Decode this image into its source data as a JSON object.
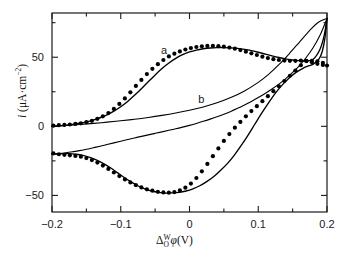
{
  "figure": {
    "background": "#ffffff",
    "ink_color": "#000000"
  },
  "chart_data": {
    "type": "line",
    "title": "",
    "subtitle": "",
    "xlabel": "Δ_O^W φ (V)",
    "xlabel_parts": {
      "delta": "Δ",
      "superscript": "W",
      "subscript": "O",
      "phi": "φ",
      "unit": "(V)"
    },
    "ylabel": "i (μA·cm⁻²)",
    "ylabel_parts": {
      "symbol": "i",
      "open": " (",
      "unit": "μA·cm",
      "exponent": "−2",
      "close": ")"
    },
    "xlim": [
      -0.2,
      0.2
    ],
    "ylim": [
      -62,
      82
    ],
    "x_major_ticks": [
      -0.2,
      -0.1,
      0,
      0.1,
      0.2
    ],
    "x_major_tick_labels": [
      "−0.2",
      "−0.1",
      "0",
      "0.1",
      "0.2"
    ],
    "x_minor_ticks": [
      -0.15,
      -0.05,
      0.05,
      0.15
    ],
    "y_major_ticks": [
      50,
      0,
      -50
    ],
    "y_major_tick_labels": [
      "50",
      "0",
      "−50"
    ],
    "y_minor_ticks": [
      75,
      25,
      -25
    ],
    "grid": false,
    "legend": "inline-annotations",
    "annotations": [
      {
        "text": "a",
        "x": -0.037,
        "y": 52,
        "name": "curve-label-a"
      },
      {
        "text": "b",
        "x": 0.017,
        "y": 17,
        "name": "curve-label-b"
      }
    ],
    "series": [
      {
        "name": "curve-a-forward",
        "style": "solid-line",
        "description": "Cyclic voltammogram a, forward (anodic) sweep from -0.2 V rising to a peak near +0.07 V then decreasing before final rise at +0.2 V",
        "points": [
          [
            -0.2,
            0.0
          ],
          [
            -0.19,
            0.4
          ],
          [
            -0.18,
            0.8
          ],
          [
            -0.17,
            1.4
          ],
          [
            -0.16,
            2.2
          ],
          [
            -0.15,
            3.2
          ],
          [
            -0.14,
            4.5
          ],
          [
            -0.13,
            6.2
          ],
          [
            -0.12,
            8.3
          ],
          [
            -0.11,
            11.0
          ],
          [
            -0.1,
            14.2
          ],
          [
            -0.09,
            18.0
          ],
          [
            -0.08,
            22.4
          ],
          [
            -0.07,
            27.2
          ],
          [
            -0.06,
            32.2
          ],
          [
            -0.05,
            37.2
          ],
          [
            -0.04,
            41.8
          ],
          [
            -0.03,
            45.8
          ],
          [
            -0.02,
            49.2
          ],
          [
            -0.01,
            51.8
          ],
          [
            0.0,
            53.8
          ],
          [
            0.01,
            55.2
          ],
          [
            0.02,
            56.1
          ],
          [
            0.03,
            56.7
          ],
          [
            0.04,
            57.0
          ],
          [
            0.05,
            57.0
          ],
          [
            0.06,
            56.8
          ],
          [
            0.07,
            56.4
          ],
          [
            0.08,
            55.7
          ],
          [
            0.09,
            54.8
          ],
          [
            0.1,
            53.6
          ],
          [
            0.11,
            52.3
          ],
          [
            0.12,
            51.0
          ],
          [
            0.13,
            49.8
          ],
          [
            0.14,
            48.8
          ],
          [
            0.15,
            48.0
          ],
          [
            0.16,
            47.5
          ],
          [
            0.17,
            47.3
          ],
          [
            0.18,
            48.6
          ],
          [
            0.19,
            56.0
          ],
          [
            0.196,
            66.0
          ],
          [
            0.2,
            78.0
          ]
        ]
      },
      {
        "name": "curve-a-reverse",
        "style": "solid-line",
        "description": "Cyclic voltammogram a, reverse (cathodic) sweep from +0.2 V down through a trough near -0.035 V back to -0.2 V",
        "points": [
          [
            0.2,
            78.0
          ],
          [
            0.197,
            64.0
          ],
          [
            0.193,
            54.0
          ],
          [
            0.188,
            48.5
          ],
          [
            0.18,
            45.0
          ],
          [
            0.172,
            43.5
          ],
          [
            0.165,
            42.0
          ],
          [
            0.155,
            39.0
          ],
          [
            0.145,
            35.0
          ],
          [
            0.135,
            30.0
          ],
          [
            0.125,
            24.0
          ],
          [
            0.115,
            17.0
          ],
          [
            0.105,
            9.5
          ],
          [
            0.095,
            1.5
          ],
          [
            0.085,
            -6.5
          ],
          [
            0.075,
            -14.0
          ],
          [
            0.065,
            -21.0
          ],
          [
            0.055,
            -27.0
          ],
          [
            0.045,
            -32.0
          ],
          [
            0.035,
            -36.5
          ],
          [
            0.025,
            -40.0
          ],
          [
            0.015,
            -43.0
          ],
          [
            0.005,
            -45.2
          ],
          [
            -0.005,
            -46.8
          ],
          [
            -0.015,
            -47.8
          ],
          [
            -0.025,
            -48.2
          ],
          [
            -0.035,
            -48.3
          ],
          [
            -0.045,
            -47.8
          ],
          [
            -0.055,
            -46.8
          ],
          [
            -0.065,
            -45.2
          ],
          [
            -0.075,
            -43.0
          ],
          [
            -0.085,
            -40.2
          ],
          [
            -0.095,
            -37.0
          ],
          [
            -0.105,
            -33.5
          ],
          [
            -0.115,
            -30.0
          ],
          [
            -0.125,
            -27.0
          ],
          [
            -0.135,
            -24.4
          ],
          [
            -0.145,
            -22.4
          ],
          [
            -0.155,
            -21.0
          ],
          [
            -0.165,
            -20.2
          ],
          [
            -0.175,
            -19.8
          ],
          [
            -0.185,
            -19.8
          ],
          [
            -0.195,
            -20.0
          ],
          [
            -0.2,
            -20.2
          ]
        ]
      },
      {
        "name": "curve-b-forward",
        "style": "solid-line-thin",
        "description": "Voltammogram b, forward sweep: small featureless rise from -0.2 V, steepening sharply after +0.1 V to +0.2 V",
        "points": [
          [
            -0.2,
            0.0
          ],
          [
            -0.18,
            0.6
          ],
          [
            -0.16,
            1.3
          ],
          [
            -0.14,
            2.1
          ],
          [
            -0.12,
            3.0
          ],
          [
            -0.1,
            4.0
          ],
          [
            -0.08,
            5.1
          ],
          [
            -0.06,
            6.4
          ],
          [
            -0.04,
            7.9
          ],
          [
            -0.02,
            9.6
          ],
          [
            0.0,
            11.6
          ],
          [
            0.02,
            14.0
          ],
          [
            0.04,
            17.0
          ],
          [
            0.06,
            20.8
          ],
          [
            0.08,
            25.6
          ],
          [
            0.1,
            31.8
          ],
          [
            0.115,
            37.6
          ],
          [
            0.13,
            44.6
          ],
          [
            0.145,
            52.5
          ],
          [
            0.16,
            61.0
          ],
          [
            0.175,
            69.5
          ],
          [
            0.188,
            75.5
          ],
          [
            0.2,
            78.0
          ]
        ]
      },
      {
        "name": "curve-b-reverse",
        "style": "solid-line-thin",
        "description": "Voltammogram b, reverse sweep: descends from +0.2 V through the middle of the frame back to about -20 uA at -0.2 V",
        "points": [
          [
            0.2,
            78.0
          ],
          [
            0.19,
            66.0
          ],
          [
            0.18,
            57.0
          ],
          [
            0.17,
            50.0
          ],
          [
            0.16,
            44.0
          ],
          [
            0.15,
            39.0
          ],
          [
            0.14,
            34.5
          ],
          [
            0.13,
            30.5
          ],
          [
            0.12,
            27.0
          ],
          [
            0.11,
            23.8
          ],
          [
            0.1,
            20.8
          ],
          [
            0.09,
            18.0
          ],
          [
            0.08,
            15.4
          ],
          [
            0.07,
            13.0
          ],
          [
            0.06,
            10.8
          ],
          [
            0.05,
            8.8
          ],
          [
            0.04,
            6.9
          ],
          [
            0.03,
            5.2
          ],
          [
            0.02,
            3.6
          ],
          [
            0.01,
            2.1
          ],
          [
            0.0,
            0.7
          ],
          [
            -0.01,
            -0.6
          ],
          [
            -0.02,
            -1.8
          ],
          [
            -0.03,
            -2.9
          ],
          [
            -0.04,
            -4.0
          ],
          [
            -0.05,
            -5.1
          ],
          [
            -0.06,
            -6.2
          ],
          [
            -0.07,
            -7.3
          ],
          [
            -0.08,
            -8.4
          ],
          [
            -0.09,
            -9.6
          ],
          [
            -0.1,
            -10.8
          ],
          [
            -0.11,
            -12.0
          ],
          [
            -0.12,
            -13.2
          ],
          [
            -0.13,
            -14.4
          ],
          [
            -0.14,
            -15.5
          ],
          [
            -0.15,
            -16.6
          ],
          [
            -0.16,
            -17.6
          ],
          [
            -0.17,
            -18.4
          ],
          [
            -0.18,
            -19.1
          ],
          [
            -0.19,
            -19.7
          ],
          [
            -0.2,
            -20.2
          ]
        ]
      },
      {
        "name": "experimental-points-upper",
        "style": "filled-circles",
        "description": "Experimental data points following the anodic branch of curve a",
        "points": [
          [
            -0.198,
            0.5
          ],
          [
            -0.19,
            0.8
          ],
          [
            -0.182,
            1.0
          ],
          [
            -0.174,
            1.3
          ],
          [
            -0.166,
            1.7
          ],
          [
            -0.158,
            2.2
          ],
          [
            -0.15,
            3.0
          ],
          [
            -0.142,
            4.0
          ],
          [
            -0.134,
            5.4
          ],
          [
            -0.126,
            7.2
          ],
          [
            -0.118,
            9.6
          ],
          [
            -0.11,
            12.6
          ],
          [
            -0.102,
            16.2
          ],
          [
            -0.094,
            20.2
          ],
          [
            -0.086,
            24.6
          ],
          [
            -0.078,
            29.2
          ],
          [
            -0.07,
            33.6
          ],
          [
            -0.062,
            37.8
          ],
          [
            -0.054,
            41.6
          ],
          [
            -0.046,
            45.0
          ],
          [
            -0.038,
            48.0
          ],
          [
            -0.03,
            50.6
          ],
          [
            -0.022,
            52.6
          ],
          [
            -0.014,
            54.2
          ],
          [
            -0.006,
            55.6
          ],
          [
            0.002,
            56.6
          ],
          [
            0.01,
            57.4
          ],
          [
            0.018,
            57.9
          ],
          [
            0.026,
            58.2
          ],
          [
            0.034,
            58.2
          ],
          [
            0.042,
            58.0
          ],
          [
            0.05,
            57.6
          ],
          [
            0.058,
            57.0
          ],
          [
            0.066,
            56.2
          ],
          [
            0.074,
            55.2
          ],
          [
            0.082,
            54.0
          ],
          [
            0.09,
            52.8
          ],
          [
            0.098,
            51.6
          ],
          [
            0.106,
            50.4
          ],
          [
            0.114,
            49.4
          ],
          [
            0.122,
            48.6
          ],
          [
            0.13,
            48.0
          ],
          [
            0.138,
            47.6
          ],
          [
            0.146,
            47.4
          ],
          [
            0.154,
            47.4
          ],
          [
            0.162,
            47.6
          ],
          [
            0.17,
            47.4
          ],
          [
            0.178,
            46.4
          ],
          [
            0.186,
            45.2
          ],
          [
            0.194,
            44.4
          ],
          [
            0.2,
            44.0
          ]
        ]
      },
      {
        "name": "experimental-points-lower",
        "style": "filled-circles",
        "description": "Experimental data points following the cathodic branch of curve a",
        "points": [
          [
            -0.198,
            -19.6
          ],
          [
            -0.19,
            -20.2
          ],
          [
            -0.182,
            -20.6
          ],
          [
            -0.174,
            -21.0
          ],
          [
            -0.166,
            -21.4
          ],
          [
            -0.158,
            -22.0
          ],
          [
            -0.15,
            -23.0
          ],
          [
            -0.142,
            -24.4
          ],
          [
            -0.134,
            -26.2
          ],
          [
            -0.126,
            -28.4
          ],
          [
            -0.118,
            -30.8
          ],
          [
            -0.11,
            -33.4
          ],
          [
            -0.102,
            -36.0
          ],
          [
            -0.094,
            -38.4
          ],
          [
            -0.086,
            -40.6
          ],
          [
            -0.078,
            -42.6
          ],
          [
            -0.07,
            -44.2
          ],
          [
            -0.062,
            -45.6
          ],
          [
            -0.054,
            -46.6
          ],
          [
            -0.046,
            -47.4
          ],
          [
            -0.038,
            -47.8
          ],
          [
            -0.03,
            -48.0
          ],
          [
            -0.022,
            -47.6
          ],
          [
            -0.014,
            -46.4
          ],
          [
            -0.006,
            -44.4
          ],
          [
            0.002,
            -41.4
          ],
          [
            0.01,
            -37.4
          ],
          [
            0.018,
            -32.6
          ],
          [
            0.026,
            -27.2
          ],
          [
            0.034,
            -21.6
          ],
          [
            0.042,
            -16.0
          ],
          [
            0.05,
            -10.6
          ],
          [
            0.058,
            -5.6
          ],
          [
            0.066,
            -1.0
          ],
          [
            0.074,
            3.2
          ],
          [
            0.082,
            7.2
          ],
          [
            0.09,
            11.0
          ],
          [
            0.098,
            14.6
          ],
          [
            0.106,
            18.2
          ],
          [
            0.114,
            21.8
          ],
          [
            0.122,
            25.4
          ],
          [
            0.13,
            29.0
          ],
          [
            0.138,
            32.8
          ],
          [
            0.146,
            36.6
          ],
          [
            0.154,
            40.4
          ],
          [
            0.162,
            44.2
          ],
          [
            0.17,
            47.2
          ],
          [
            0.178,
            47.4
          ],
          [
            0.186,
            47.0
          ],
          [
            0.194,
            46.0
          ]
        ]
      }
    ]
  }
}
